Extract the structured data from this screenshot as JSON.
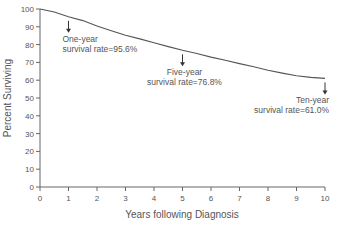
{
  "chart_data": {
    "type": "line",
    "title": "",
    "xlabel": "Years following Diagnosis",
    "ylabel": "Percent Surviving",
    "xlim": [
      0,
      10
    ],
    "ylim": [
      0,
      100
    ],
    "x_ticks": [
      0,
      1,
      2,
      3,
      4,
      5,
      6,
      7,
      8,
      9,
      10
    ],
    "y_ticks": [
      0,
      10,
      20,
      30,
      40,
      50,
      60,
      70,
      80,
      90,
      100
    ],
    "grid": false,
    "legend": null,
    "series": [
      {
        "name": "Survival",
        "x": [
          0,
          0.5,
          1,
          1.5,
          2,
          2.5,
          3,
          3.5,
          4,
          4.5,
          5,
          5.5,
          6,
          6.5,
          7,
          7.5,
          8,
          8.5,
          9,
          9.5,
          10
        ],
        "y": [
          100,
          98.3,
          95.6,
          93.5,
          90.5,
          87.8,
          85.3,
          83.2,
          81.0,
          78.9,
          76.8,
          75.0,
          73.0,
          71.2,
          69.3,
          67.5,
          65.6,
          64.0,
          62.5,
          61.6,
          61.0
        ]
      }
    ],
    "annotations": [
      {
        "x": 1,
        "y": 95.6,
        "line1": "One-year",
        "line2": "survival rate=95.6%"
      },
      {
        "x": 5,
        "y": 76.8,
        "line1": "Five-year",
        "line2": "survival rate=76.8%"
      },
      {
        "x": 10,
        "y": 61.0,
        "line1": "Ten-year",
        "line2": "survival rate=61.0%"
      }
    ]
  }
}
